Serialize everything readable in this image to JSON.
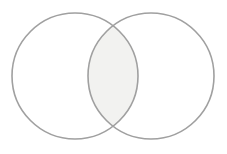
{
  "figure": {
    "name": "two-set-venn-diagram",
    "type": "venn",
    "width": 227,
    "height": 154,
    "background_color": "#ffffff",
    "title": "",
    "labels_visible": false
  },
  "chart_data": {
    "type": "venn",
    "title": "",
    "subtitle": "",
    "xlabel": "",
    "ylabel": "",
    "grid": false,
    "legend": "none",
    "annotations": [],
    "sets": [
      {
        "id": "set-a",
        "label": "",
        "center_x": 75,
        "center_y": 76,
        "radius": 63,
        "fill": "#ffffff",
        "fill_opacity": 0,
        "stroke": "#a0a0a0",
        "stroke_width": 1.6
      },
      {
        "id": "set-b",
        "label": "",
        "center_x": 151,
        "center_y": 76,
        "radius": 63,
        "fill": "#ffffff",
        "fill_opacity": 0,
        "stroke": "#a0a0a0",
        "stroke_width": 1.6
      }
    ],
    "intersection": {
      "id": "set-a-and-b",
      "label": "",
      "fill": "#f2f2f0",
      "fill_opacity": 1,
      "stroke": "none",
      "left_x": 88,
      "right_x": 138,
      "top_y": 26,
      "bottom_y": 126
    },
    "colors": {
      "stroke": "#a0a0a0",
      "overlap_fill": "#f2f2f0",
      "background": "#ffffff"
    }
  }
}
